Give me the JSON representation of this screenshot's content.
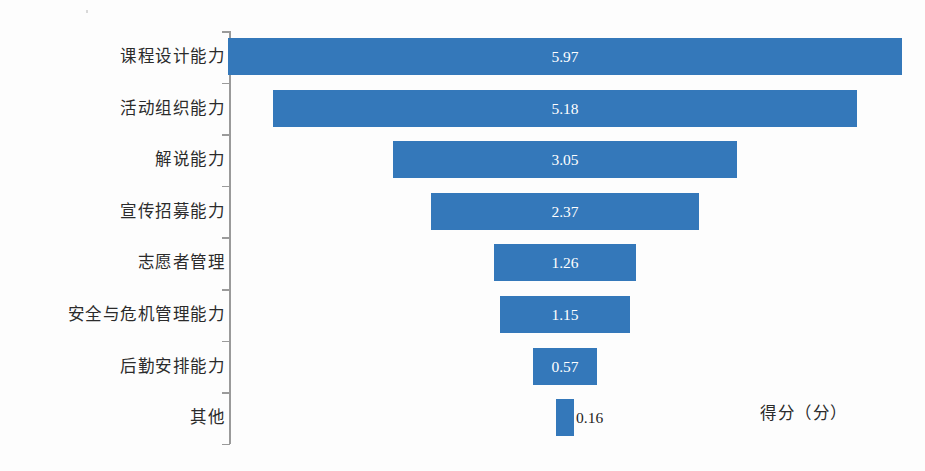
{
  "chart_data": {
    "type": "bar",
    "orientation": "funnel-horizontal-centered",
    "title": "",
    "xlabel": "得分（分）",
    "ylabel": "",
    "grid": false,
    "legend": null,
    "axis_line": true,
    "categories": [
      "课程设计能力",
      "活动组织能力",
      "解说能力",
      "宣传招募能力",
      "志愿者管理",
      "安全与危机管理能力",
      "后勤安排能力",
      "其他"
    ],
    "values": [
      5.97,
      5.18,
      3.05,
      2.37,
      1.26,
      1.15,
      0.57,
      0.16
    ],
    "value_labels": [
      "5.97",
      "5.18",
      "3.05",
      "2.37",
      "1.26",
      "1.15",
      "0.57",
      "0.16"
    ],
    "label_positions": [
      "inside",
      "inside",
      "inside",
      "inside",
      "inside",
      "inside",
      "inside",
      "outside"
    ],
    "xlim": [
      0,
      5.97
    ],
    "bar_color": "#3478ba",
    "inside_label_color": "#ffffff",
    "outside_label_color": "#1d1d1d",
    "axis_color": "#9a9a9a",
    "background_color": "#fdfdfd"
  },
  "axis": {
    "caption": "得分（分）"
  }
}
